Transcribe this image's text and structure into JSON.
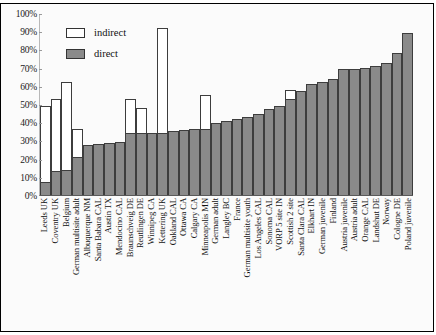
{
  "chart_data": {
    "type": "bar",
    "stacked": true,
    "title": "",
    "subtitle": "",
    "xlabel": "",
    "ylabel": "",
    "ylim": [
      0,
      100
    ],
    "ytick_labels": [
      "100%",
      "90%",
      "80%",
      "70%",
      "60%",
      "50%",
      "40%",
      "30%",
      "20%",
      "10%",
      "0%"
    ],
    "ytick_values": [
      100,
      90,
      80,
      70,
      60,
      50,
      40,
      30,
      20,
      10,
      0
    ],
    "grid": false,
    "legend_position": "top-left",
    "legend": [
      "indirect",
      "direct"
    ],
    "colors": {
      "indirect": "#ffffff",
      "direct": "#8a8a8a",
      "outline": "#3d3d3d"
    },
    "categories": [
      "Leeds UK",
      "Coventry UK",
      "Belgium",
      "German multisite adult",
      "Albuquerque NM",
      "Santa Babara CAL",
      "Austin TX",
      "Mendocino CAL",
      "Braunschveig DE",
      "Reutlingen DE",
      "Winnipeg CA",
      "Kettering UK",
      "Oakland CAL",
      "Ottawa CA",
      "Calgary CA",
      "Minneapolis MN",
      "German adult",
      "Langley BC",
      "France",
      "German multisite youth",
      "Los Angeles CAL",
      "Sonoma CAL",
      "VORP 5 site IN",
      "Scottish 2 site",
      "Santa Clara CAL",
      "Elkhart IN",
      "German juvenile",
      "Finland",
      "Austria juvenile",
      "Austria adult",
      "Orange CAL",
      "Landshut DE",
      "Norway",
      "Cologne DE",
      "Poland juvenile"
    ],
    "series": [
      {
        "name": "direct",
        "values": [
          7,
          13,
          13.5,
          21,
          27.5,
          28,
          28.5,
          29,
          34,
          34,
          34,
          34,
          35,
          35.5,
          36.5,
          36.5,
          39.5,
          40.5,
          42,
          43,
          44.5,
          47,
          49,
          53,
          57,
          61,
          62,
          64,
          69,
          69.5,
          70,
          71,
          72.5,
          78,
          89
        ]
      },
      {
        "name": "indirect",
        "values": [
          42,
          40,
          48.5,
          15,
          0,
          0,
          0,
          0,
          19,
          14,
          0,
          58,
          0,
          0,
          0,
          18.5,
          0,
          0,
          0,
          0,
          0,
          0,
          0,
          4.5,
          0,
          0,
          0,
          0,
          0,
          0,
          0,
          0,
          0,
          0,
          0
        ]
      }
    ],
    "totals": [
      49,
      53,
      62,
      36,
      27.5,
      28,
      28.5,
      29,
      53,
      48,
      34,
      92,
      35,
      35.5,
      36.5,
      55,
      39.5,
      40.5,
      42,
      43,
      44.5,
      47,
      49,
      57.5,
      57,
      61,
      62,
      64,
      69,
      69.5,
      70,
      71,
      72.5,
      78,
      89
    ]
  }
}
